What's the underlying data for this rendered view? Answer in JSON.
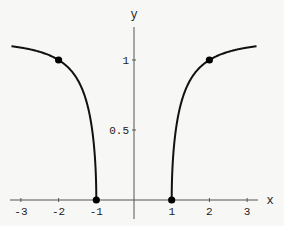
{
  "chart_data": {
    "type": "line",
    "title": "",
    "xlabel": "x",
    "ylabel": "y",
    "xlim": [
      -3.3,
      3.3
    ],
    "ylim": [
      0,
      1.2
    ],
    "grid": false,
    "legend": null,
    "x_ticks": [
      -3,
      -2,
      -1,
      1,
      2,
      3
    ],
    "x_tick_labels": [
      "-3",
      "-2",
      "-1",
      "1",
      "2",
      "3"
    ],
    "y_ticks": [
      0.5,
      1
    ],
    "y_tick_labels": [
      "0.5",
      "1"
    ],
    "series": [
      {
        "name": "left branch",
        "x": [
          -3.25,
          -3,
          -2.5,
          -2,
          -1.5,
          -1.25,
          -1.1,
          -1.05,
          -1
        ],
        "y": [
          1.1,
          1.09,
          1.06,
          1.0,
          0.86,
          0.69,
          0.48,
          0.35,
          0
        ]
      },
      {
        "name": "right branch",
        "x": [
          1,
          1.05,
          1.1,
          1.25,
          1.5,
          2,
          2.5,
          3,
          3.25
        ],
        "y": [
          0,
          0.35,
          0.48,
          0.69,
          0.86,
          1.0,
          1.06,
          1.09,
          1.1
        ]
      }
    ],
    "points": [
      {
        "x": -2,
        "y": 1
      },
      {
        "x": -1,
        "y": 0
      },
      {
        "x": 1,
        "y": 0
      },
      {
        "x": 2,
        "y": 1
      }
    ]
  }
}
